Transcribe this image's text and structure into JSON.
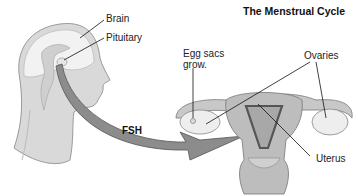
{
  "title": "The Menstrual Cycle",
  "labels": {
    "brain": "Brain",
    "pituitary": "Pituitary",
    "egg_sacs_line1": "Egg sacs",
    "egg_sacs_line2": "grow.",
    "ovaries": "Ovaries",
    "uterus": "Uterus",
    "hormone_arrow": "FSH"
  },
  "colors": {
    "background": "#ffffff",
    "head_fill": "#d9d9d9",
    "head_outline": "#9a9a9a",
    "brain_fill": "#f2f2f2",
    "arrow_fill": "#8c8c8c",
    "arrow_outline": "#555555",
    "uterus_fill": "#bdbdbd",
    "uterus_dark": "#555555",
    "ovary_fill": "#eeeeee",
    "leader_line": "#111111"
  }
}
